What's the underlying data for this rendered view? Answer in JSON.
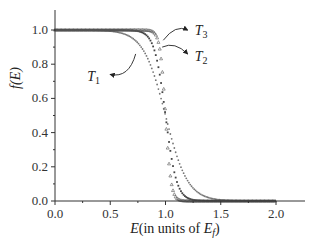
{
  "chart_data": {
    "type": "scatter",
    "title": "",
    "xlabel": "E(in units of E_f)",
    "xlabel_parts": {
      "main": "E",
      "rest": "(in units of ",
      "var": "E",
      "sub": "f",
      "close": ")"
    },
    "ylabel": "f(E)",
    "xlim": [
      0.0,
      2.2
    ],
    "ylim": [
      0.0,
      1.05
    ],
    "xticks": [
      "0.0",
      "0.5",
      "1.0",
      "1.5",
      "2.0"
    ],
    "xtick_values": [
      0.0,
      0.5,
      1.0,
      1.5,
      2.0
    ],
    "yticks": [
      "0.0",
      "0.2",
      "0.4",
      "0.6",
      "0.8",
      "1.0"
    ],
    "ytick_values": [
      0.0,
      0.2,
      0.4,
      0.6,
      0.8,
      1.0
    ],
    "grid": false,
    "legend": "none (curves labeled with arrow annotations)",
    "x": [
      0.0,
      0.05,
      0.1,
      0.15,
      0.2,
      0.25,
      0.3,
      0.35,
      0.4,
      0.45,
      0.5,
      0.55,
      0.6,
      0.65,
      0.7,
      0.75,
      0.8,
      0.85,
      0.9,
      0.95,
      1.0,
      1.05,
      1.1,
      1.15,
      1.2,
      1.25,
      1.3,
      1.35,
      1.4,
      1.45,
      1.5,
      1.55,
      1.6,
      1.65,
      1.7,
      1.75,
      1.8,
      1.85,
      1.9,
      1.95,
      2.0
    ],
    "series": [
      {
        "name": "T1",
        "marker": "dot",
        "values": [
          1.0,
          1.0,
          1.0,
          1.0,
          1.0,
          1.0,
          0.999,
          0.998,
          0.998,
          0.996,
          0.993,
          0.989,
          0.982,
          0.971,
          0.953,
          0.924,
          0.881,
          0.818,
          0.731,
          0.622,
          0.5,
          0.378,
          0.269,
          0.182,
          0.119,
          0.076,
          0.047,
          0.029,
          0.018,
          0.011,
          0.007,
          0.004,
          0.002,
          0.002,
          0.001,
          0.001,
          0.0,
          0.0,
          0.0,
          0.0,
          0.0
        ]
      },
      {
        "name": "T2",
        "marker": "square",
        "values": [
          1.0,
          1.0,
          1.0,
          1.0,
          1.0,
          1.0,
          1.0,
          1.0,
          1.0,
          1.0,
          1.0,
          1.0,
          1.0,
          0.999,
          0.998,
          0.993,
          0.982,
          0.953,
          0.881,
          0.731,
          0.5,
          0.269,
          0.119,
          0.047,
          0.018,
          0.007,
          0.002,
          0.001,
          0.0,
          0.0,
          0.0,
          0.0,
          0.0,
          0.0,
          0.0,
          0.0,
          0.0,
          0.0,
          0.0,
          0.0,
          0.0
        ]
      },
      {
        "name": "T3",
        "marker": "triangle",
        "values": [
          1.0,
          1.0,
          1.0,
          1.0,
          1.0,
          1.0,
          1.0,
          1.0,
          1.0,
          1.0,
          1.0,
          1.0,
          1.0,
          1.0,
          1.0,
          1.0,
          1.0,
          0.998,
          0.982,
          0.881,
          0.5,
          0.119,
          0.018,
          0.002,
          0.0,
          0.0,
          0.0,
          0.0,
          0.0,
          0.0,
          0.0,
          0.0,
          0.0,
          0.0,
          0.0,
          0.0,
          0.0,
          0.0,
          0.0,
          0.0,
          0.0
        ]
      }
    ],
    "annotations": [
      {
        "label": "T",
        "sub": "1",
        "series": "T1",
        "text_x": 0.4,
        "text_y": 0.73,
        "arrow_from": [
          0.73,
          0.86
        ],
        "arrow_to": [
          0.5,
          0.74
        ]
      },
      {
        "label": "T",
        "sub": "2",
        "series": "T2",
        "text_x": 1.22,
        "text_y": 0.85,
        "arrow_from": [
          0.97,
          0.9
        ],
        "arrow_to": [
          1.2,
          0.86
        ]
      },
      {
        "label": "T",
        "sub": "3",
        "series": "T3",
        "text_x": 1.22,
        "text_y": 1.0,
        "arrow_from": [
          0.98,
          0.94
        ],
        "arrow_to": [
          1.2,
          1.0
        ]
      }
    ],
    "colors": {
      "axis": "#333333",
      "series": "#555555",
      "text": "#222222"
    }
  }
}
